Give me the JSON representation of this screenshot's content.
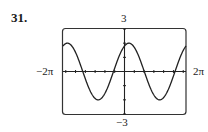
{
  "problem_number": "31.",
  "chart_data": {
    "type": "line",
    "title": "",
    "xlabel": "",
    "ylabel": "",
    "xlim_label": [
      "−2π",
      "2π"
    ],
    "ylim_label": [
      "−3",
      "3"
    ],
    "xlim": [
      -6.2832,
      6.2832
    ],
    "ylim": [
      -3,
      3
    ],
    "grid": false,
    "x_ticks_spacing": 1,
    "y_ticks_spacing": 1,
    "series": [
      {
        "name": "curve",
        "function": "y ≈ 2·cos(x − 0.45)",
        "amplitude": 2,
        "period": 6.2832,
        "phase_shift": 0.45
      }
    ]
  },
  "labels": {
    "xmin": "−2π",
    "xmax": "2π",
    "ymax": "3",
    "ymin": "−3"
  },
  "colors": {
    "ink": "#1a1a1a",
    "frame": "#333333"
  }
}
